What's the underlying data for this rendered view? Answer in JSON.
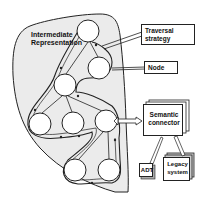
{
  "diagram": {
    "region": {
      "label_line1": "Intermediate",
      "label_line2": "Representation"
    },
    "callouts": {
      "traversal": {
        "line1": "Traversal",
        "line2": "strategy"
      },
      "node": {
        "label": "Node"
      }
    },
    "semantic_connector": {
      "line1": "Semantic",
      "line2": "connector"
    },
    "adt": {
      "label": "ADT"
    },
    "legacy": {
      "line1": "Legacy",
      "line2": "system"
    },
    "nodes": [
      {
        "id": "n1",
        "x": 88,
        "y": 31
      },
      {
        "id": "n2",
        "x": 99,
        "y": 68
      },
      {
        "id": "n3",
        "x": 65,
        "y": 85
      },
      {
        "id": "n4",
        "x": 40,
        "y": 124
      },
      {
        "id": "n5",
        "x": 73,
        "y": 123
      },
      {
        "id": "n6",
        "x": 106,
        "y": 121
      },
      {
        "id": "n7",
        "x": 75,
        "y": 170
      },
      {
        "id": "n8",
        "x": 109,
        "y": 170
      }
    ],
    "colors": {
      "region_fill": "#ebebeb",
      "stroke": "#222222",
      "background": "#ffffff"
    }
  }
}
